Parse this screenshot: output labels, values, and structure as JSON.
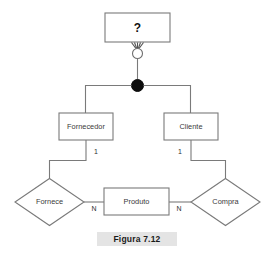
{
  "figure": {
    "caption": "Figura 7.12",
    "caption_background": "#e4e4e4"
  },
  "diagram": {
    "type": "entity-relationship-diagram",
    "line_color": "#7a7a7a",
    "box_fill": "#ffffff",
    "supertype": {
      "label": "?",
      "name": "unknown-supertype-entity"
    },
    "specialization": {
      "hollow_circle_label": "",
      "filled_circle_label": "",
      "note": "generalization arrow into hollow circle, then filled disjointness hub"
    },
    "entities": [
      {
        "id": "fornecedor",
        "label": "Fornecedor"
      },
      {
        "id": "cliente",
        "label": "Cliente"
      },
      {
        "id": "produto",
        "label": "Produto"
      }
    ],
    "relationships": [
      {
        "id": "fornece",
        "label": "Fornece"
      },
      {
        "id": "compra",
        "label": "Compra"
      }
    ],
    "cardinalities": {
      "fornecedor_fornece": "1",
      "fornece_produto": "N",
      "produto_compra": "N",
      "cliente_compra": "1"
    }
  }
}
